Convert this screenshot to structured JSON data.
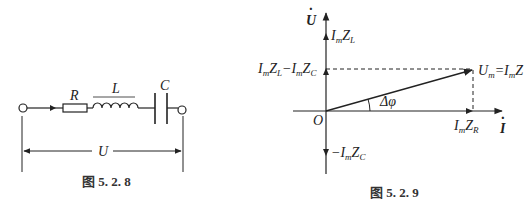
{
  "figure_left": {
    "caption": "图 5. 2. 8",
    "components": [
      {
        "type": "resistor",
        "label": "R"
      },
      {
        "type": "inductor",
        "label": "L"
      },
      {
        "type": "capacitor",
        "label": "C"
      }
    ],
    "voltage_label": "U"
  },
  "figure_right": {
    "caption": "图 5. 2. 9",
    "axes": {
      "vertical": "U",
      "horizontal": "I",
      "origin": "O"
    },
    "labels": {
      "imzl": "I",
      "imzl_sub1": "m",
      "imzl_z": "Z",
      "imzl_sub2": "L",
      "diff": "IₘZₗ−IₘZ_C",
      "um": "U",
      "um_sub": "m",
      "um_eq": "=I",
      "um_eq_sub": "m",
      "um_z": "Z",
      "imzr": "I",
      "imzr_sub1": "m",
      "imzr_z": "Z",
      "imzr_sub2": "R",
      "negc": "−I",
      "negc_sub1": "m",
      "negc_z": "Z",
      "negc_sub2": "C",
      "delta_phi": "Δφ"
    }
  },
  "colors": {
    "line": "#222222",
    "background": "#ffffff"
  }
}
